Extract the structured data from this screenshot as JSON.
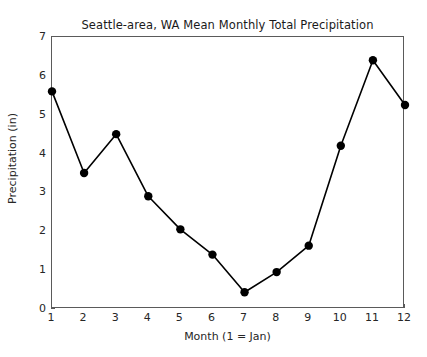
{
  "chart_data": {
    "type": "line",
    "title": "Seattle-area, WA Mean Monthly Total Precipitation",
    "xlabel": "Month (1 = Jan)",
    "ylabel": "Precipitation (in)",
    "x": [
      1,
      2,
      3,
      4,
      5,
      6,
      7,
      8,
      9,
      10,
      11,
      12
    ],
    "values": [
      5.6,
      3.5,
      4.5,
      2.9,
      2.05,
      1.4,
      0.43,
      0.95,
      1.63,
      4.2,
      6.4,
      5.25
    ],
    "categories": [
      "1",
      "2",
      "3",
      "4",
      "5",
      "6",
      "7",
      "8",
      "9",
      "10",
      "11",
      "12"
    ],
    "xtick_labels": [
      "1",
      "2",
      "3",
      "4",
      "5",
      "6",
      "7",
      "8",
      "9",
      "10",
      "11",
      "12"
    ],
    "ytick_labels": [
      "0",
      "1",
      "2",
      "3",
      "4",
      "5",
      "6",
      "7"
    ],
    "ytick_values": [
      0,
      1,
      2,
      3,
      4,
      5,
      6,
      7
    ],
    "xlim": [
      1,
      12
    ],
    "ylim": [
      0,
      7
    ],
    "grid": false,
    "legend": false,
    "marker": "circle",
    "line_color": "#000000",
    "marker_color": "#000000",
    "background_color": "#ffffff",
    "axis_color": "#5a5a5a"
  }
}
